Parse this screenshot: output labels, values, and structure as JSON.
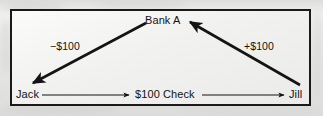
{
  "figure": {
    "frame": {
      "border_color": "#1a1a1a",
      "background_color": "#f2f2f0",
      "page_background_color": "#e8e8e6"
    },
    "nodes": [
      {
        "id": "bank",
        "label": "Bank A",
        "x": 165,
        "y": 21
      },
      {
        "id": "jack",
        "label": "Jack",
        "x": 27,
        "y": 95
      },
      {
        "id": "check",
        "label": "$100 Check",
        "x": 167,
        "y": 95
      },
      {
        "id": "jill",
        "label": "Jill",
        "x": 297,
        "y": 95
      }
    ],
    "edges": [
      {
        "id": "bank-to-jack",
        "label": "−$100",
        "from": "bank",
        "to": "jack",
        "direction": "down-left",
        "arrowhead": "end",
        "style": "thick",
        "label_x": 50,
        "label_y": 41
      },
      {
        "id": "jill-to-bank",
        "label": "+$100",
        "from": "jill",
        "to": "bank",
        "direction": "up-left",
        "arrowhead": "end",
        "style": "thick",
        "label_x": 244,
        "label_y": 41
      },
      {
        "id": "jack-to-check",
        "label": "",
        "from": "jack",
        "to": "check",
        "direction": "right",
        "arrowhead": "end",
        "style": "thin"
      },
      {
        "id": "check-to-jill",
        "label": "",
        "from": "check",
        "to": "jill",
        "direction": "right",
        "arrowhead": "end",
        "style": "thin"
      }
    ],
    "colors": {
      "ink": "#131313",
      "line": "#1a1a1a"
    }
  }
}
